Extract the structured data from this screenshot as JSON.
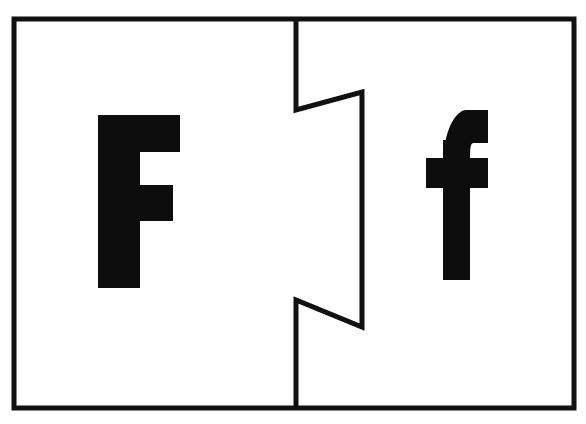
{
  "card": {
    "kind": "alphabet-puzzle-flashcard",
    "letter": "F",
    "subject": "Letter F uppercase and lowercase matching puzzle card",
    "background_color": "#ffffff",
    "ink_color": "#0d0d0d",
    "border": {
      "color": "#111111",
      "stroke_width": 5,
      "x": 14,
      "y": 19,
      "width": 560,
      "height": 389
    },
    "divider": {
      "name": "jigsaw-puzzle-cut",
      "color": "#111111",
      "stroke_width": 5,
      "orientation": "vertical",
      "description": "Vertical line with two inward zigzag notches forming an interlocking puzzle cut",
      "points": "296,19 296,110 362,92 362,327 296,300 296,408"
    },
    "left_piece": {
      "name": "uppercase-piece",
      "glyph": "F",
      "case": "uppercase",
      "fill": "#0d0d0d",
      "bounds": {
        "x": 98,
        "y": 115,
        "width": 82,
        "height": 173
      },
      "outline": "98,115 180,115 180,152 140,152 140,185 173,185 173,221 140,221 140,288 98,288"
    },
    "right_piece": {
      "name": "lowercase-piece",
      "glyph": "f",
      "case": "lowercase",
      "fill": "#0d0d0d",
      "bounds": {
        "x": 426,
        "y": 110,
        "width": 62,
        "height": 170
      },
      "stem": {
        "x": 443,
        "y": 110,
        "width": 27,
        "height": 170
      },
      "crossbar": {
        "x": 426,
        "y": 158,
        "width": 62,
        "height": 30
      },
      "hook": {
        "top": 110,
        "right": 488
      }
    },
    "panels": [
      {
        "name": "left-panel",
        "label": "F"
      },
      {
        "name": "right-panel",
        "label": "f"
      }
    ]
  }
}
